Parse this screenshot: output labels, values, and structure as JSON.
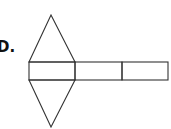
{
  "label": "D.",
  "diagram": {
    "type": "net of a triangular prism",
    "stroke_color": "#333333",
    "rectangles": [
      {
        "x": 29,
        "y": 62,
        "w": 46,
        "h": 18
      },
      {
        "x": 75,
        "y": 62,
        "w": 47,
        "h": 18
      },
      {
        "x": 122,
        "y": 62,
        "w": 46,
        "h": 18
      }
    ],
    "triangles": [
      {
        "points": "29,62 51,15 75,62",
        "position": "top"
      },
      {
        "points": "29,80 51,127 75,80",
        "position": "bottom"
      }
    ]
  }
}
